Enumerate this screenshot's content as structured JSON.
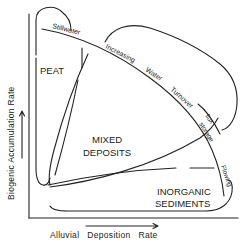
{
  "diagram": {
    "type": "conceptual phase diagram",
    "axes": {
      "x_label": "Alluvial   Deposition   Rate",
      "y_label": "Biogenic   Accumulation   Rate"
    },
    "regions": {
      "peat": "PEAT",
      "mixed_line1": "MIXED",
      "mixed_line2": "DEPOSITS",
      "inorganic_line1": "INORGANIC",
      "inorganic_line2": "SEDIMENTS"
    },
    "curve_labels": {
      "stillwater": "Stillwater",
      "increasing": "Increasing",
      "water": "Water",
      "turnover": "Turnover",
      "flux": "flux",
      "storage": "storage",
      "flowing": "Flowing"
    },
    "colors": {
      "ink": "#222222",
      "background": "#ffffff"
    }
  }
}
